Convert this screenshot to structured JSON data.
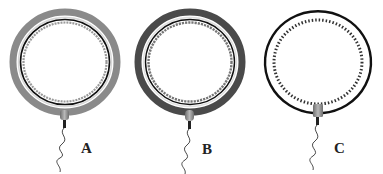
{
  "figure": {
    "panels": [
      {
        "id": "A",
        "label": "A",
        "cx": 65,
        "cy": 62,
        "rx": 53,
        "ry": 51,
        "outer_band_color": "#8a8a8a",
        "style": "gray-band-with-circle-beads"
      },
      {
        "id": "B",
        "label": "B",
        "cx": 190,
        "cy": 62,
        "rx": 53,
        "ry": 51,
        "outer_band_color": "#4a4a4a",
        "style": "dark-band-with-circle-beads"
      },
      {
        "id": "C",
        "label": "C",
        "cx": 318,
        "cy": 62,
        "rx": 54,
        "ry": 51,
        "outer_band_color": "#111111",
        "style": "thin-black-ring-with-dashed-beads-open-bottom"
      }
    ],
    "connector_color": "#9a9a9a",
    "wire_color": "#222222"
  }
}
